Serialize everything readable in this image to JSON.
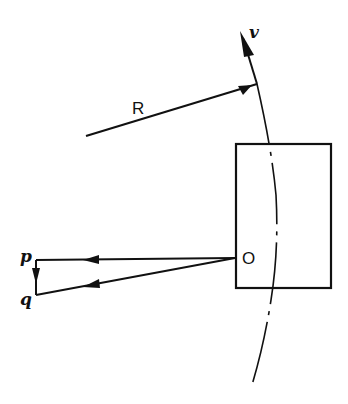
{
  "diagram": {
    "type": "vector diagram",
    "labels": {
      "R": "R",
      "v": "v",
      "O": "O",
      "p": "p",
      "q": "q"
    },
    "elements": [
      {
        "id": "R-vector",
        "label": "R",
        "description": "Position vector pointing up-right to a point on the arc"
      },
      {
        "id": "v-vector",
        "label": "v",
        "description": "Velocity vector tangent to the arc, pointing upward"
      },
      {
        "id": "arc",
        "description": "Dash-dot curved path (circular arc) passing through the rectangle"
      },
      {
        "id": "rectangle",
        "description": "Rectangular body containing point O"
      },
      {
        "id": "Op-vector",
        "from": "O",
        "to": "p",
        "description": "Horizontal vector from O to p"
      },
      {
        "id": "Oq-vector",
        "from": "O",
        "to": "q",
        "description": "Vector from O to q, slightly below Op"
      },
      {
        "id": "pq-vector",
        "from": "p",
        "to": "q",
        "description": "Short vertical vector from p down to q"
      }
    ],
    "colors": {
      "stroke": "#111111",
      "background": "#ffffff"
    }
  }
}
